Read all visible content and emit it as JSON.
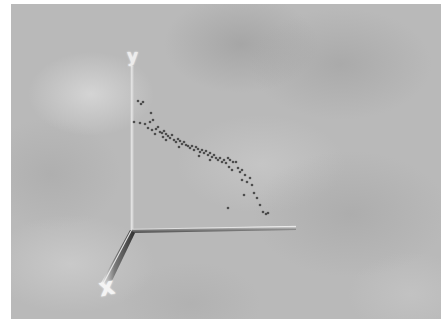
{
  "chart_data": {
    "type": "scatter",
    "title": "",
    "render": "3d",
    "xlabel": "x",
    "ylabel": "y",
    "zlabel": "",
    "grid": false,
    "legend": null,
    "background": "cloudy gray texture",
    "axes": {
      "y": {
        "label": "y",
        "from": [
          132,
          232
        ],
        "to": [
          132,
          66
        ]
      },
      "x": {
        "label": "x",
        "from": [
          132,
          232
        ],
        "to": [
          104,
          288
        ]
      },
      "z": {
        "label": "",
        "from": [
          132,
          232
        ],
        "to": [
          296,
          228
        ]
      }
    },
    "point_color": "#3a3a3a",
    "trend": "descending from upper-left to lower-right",
    "points_screen": [
      [
        138,
        101
      ],
      [
        141,
        104
      ],
      [
        143,
        102
      ],
      [
        151,
        113
      ],
      [
        134,
        122
      ],
      [
        140,
        123
      ],
      [
        145,
        124
      ],
      [
        150,
        122
      ],
      [
        153,
        120
      ],
      [
        148,
        128
      ],
      [
        152,
        130
      ],
      [
        156,
        129
      ],
      [
        158,
        127
      ],
      [
        160,
        132
      ],
      [
        155,
        134
      ],
      [
        162,
        133
      ],
      [
        164,
        131
      ],
      [
        166,
        134
      ],
      [
        163,
        137
      ],
      [
        168,
        136
      ],
      [
        170,
        138
      ],
      [
        172,
        135
      ],
      [
        166,
        140
      ],
      [
        174,
        140
      ],
      [
        176,
        142
      ],
      [
        178,
        139
      ],
      [
        180,
        141
      ],
      [
        182,
        144
      ],
      [
        184,
        142
      ],
      [
        186,
        145
      ],
      [
        179,
        147
      ],
      [
        188,
        146
      ],
      [
        190,
        148
      ],
      [
        192,
        146
      ],
      [
        194,
        150
      ],
      [
        196,
        147
      ],
      [
        198,
        149
      ],
      [
        200,
        152
      ],
      [
        202,
        150
      ],
      [
        204,
        153
      ],
      [
        206,
        151
      ],
      [
        199,
        156
      ],
      [
        208,
        155
      ],
      [
        210,
        153
      ],
      [
        212,
        157
      ],
      [
        214,
        155
      ],
      [
        216,
        158
      ],
      [
        210,
        160
      ],
      [
        218,
        160
      ],
      [
        220,
        158
      ],
      [
        222,
        162
      ],
      [
        224,
        160
      ],
      [
        226,
        163
      ],
      [
        228,
        158
      ],
      [
        230,
        160
      ],
      [
        233,
        162
      ],
      [
        236,
        162
      ],
      [
        229,
        167
      ],
      [
        232,
        170
      ],
      [
        238,
        168
      ],
      [
        240,
        172
      ],
      [
        242,
        170
      ],
      [
        245,
        175
      ],
      [
        242,
        180
      ],
      [
        247,
        182
      ],
      [
        250,
        178
      ],
      [
        252,
        185
      ],
      [
        244,
        195
      ],
      [
        254,
        193
      ],
      [
        257,
        198
      ],
      [
        260,
        205
      ],
      [
        263,
        212
      ],
      [
        266,
        214
      ],
      [
        268,
        213
      ],
      [
        228,
        208
      ]
    ]
  }
}
